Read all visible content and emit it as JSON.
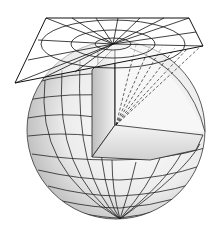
{
  "diagram": {
    "colors": {
      "line": "#1a1a1a",
      "globe_light": "#f4f4f4",
      "globe_mid": "#cfcfcf",
      "globe_dark": "#9a9a9a",
      "cut_face": "#e6e6e6",
      "background": "#ffffff"
    },
    "globe": {
      "cx": 116,
      "cy": 130,
      "r": 89
    },
    "plane": {
      "corners": [
        [
          46,
          18
        ],
        [
          189,
          18
        ],
        [
          203,
          46
        ],
        [
          15,
          83
        ]
      ],
      "center": [
        113,
        44
      ]
    },
    "wedge_center": [
      115,
      125
    ],
    "projection_rays": 6
  }
}
